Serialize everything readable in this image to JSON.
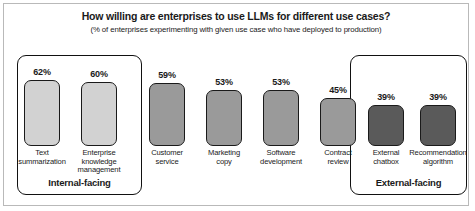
{
  "chart_data": {
    "type": "bar",
    "title": "How willing are enterprises to use LLMs for different use cases?",
    "subtitle": "(% of enterprises experimenting with given use case who have deployed to production)",
    "xlabel": "",
    "ylabel": "",
    "ylim": [
      0,
      70
    ],
    "grid": false,
    "legend": "none",
    "categories": [
      "Text summarization",
      "Enterprise knowledge management",
      "Customer service",
      "Marketing copy",
      "Software development",
      "Contract review",
      "External chatbox",
      "Recommendation algorithm"
    ],
    "values": [
      62,
      60,
      59,
      53,
      53,
      45,
      39,
      39
    ],
    "value_labels": [
      "62%",
      "60%",
      "59%",
      "53%",
      "53%",
      "45%",
      "39%",
      "39%"
    ],
    "bars": [
      {
        "label_line1": "Text",
        "label_line2": "summarization",
        "label_line3": "",
        "value": 62,
        "value_label": "62%",
        "group": "Internal-facing",
        "color": "#d2d2d2"
      },
      {
        "label_line1": "Enterprise",
        "label_line2": "knowledge",
        "label_line3": "management",
        "value": 60,
        "value_label": "60%",
        "group": "Internal-facing",
        "color": "#d2d2d2"
      },
      {
        "label_line1": "Customer",
        "label_line2": "service",
        "label_line3": "",
        "value": 59,
        "value_label": "59%",
        "group": "",
        "color": "#9a9a9a"
      },
      {
        "label_line1": "Marketing",
        "label_line2": "copy",
        "label_line3": "",
        "value": 53,
        "value_label": "53%",
        "group": "",
        "color": "#9a9a9a"
      },
      {
        "label_line1": "Software",
        "label_line2": "development",
        "label_line3": "",
        "value": 53,
        "value_label": "53%",
        "group": "",
        "color": "#9a9a9a"
      },
      {
        "label_line1": "Contract",
        "label_line2": "review",
        "label_line3": "",
        "value": 45,
        "value_label": "45%",
        "group": "",
        "color": "#9a9a9a"
      },
      {
        "label_line1": "External",
        "label_line2": "chatbox",
        "label_line3": "",
        "value": 39,
        "value_label": "39%",
        "group": "External-facing",
        "color": "#5a5a5a"
      },
      {
        "label_line1": "Recommendation",
        "label_line2": "algorithm",
        "label_line3": "",
        "value": 39,
        "value_label": "39%",
        "group": "External-facing",
        "color": "#5a5a5a"
      }
    ],
    "groups": [
      {
        "name": "Internal-facing",
        "bar_indices": [
          0,
          1
        ]
      },
      {
        "name": "External-facing",
        "bar_indices": [
          6,
          7
        ]
      }
    ]
  }
}
